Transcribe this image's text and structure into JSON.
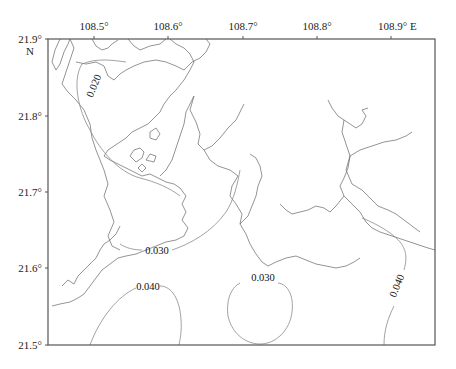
{
  "map": {
    "x_axis": {
      "ticks": [
        {
          "label": "108.5°",
          "x": 94
        },
        {
          "label": "108.6°",
          "x": 168
        },
        {
          "label": "108.7°",
          "x": 243
        },
        {
          "label": "108.8°",
          "x": 317
        },
        {
          "label": "108.9° E",
          "x": 391
        }
      ]
    },
    "y_axis": {
      "ticks": [
        {
          "label": "21.9°",
          "y": 39
        },
        {
          "label": "21.8°",
          "y": 116
        },
        {
          "label": "21.7°",
          "y": 192
        },
        {
          "label": "21.6°",
          "y": 268
        },
        {
          "label": "21.5°",
          "y": 345
        }
      ],
      "hemisphere_label": "N"
    },
    "contours": [
      {
        "value": "0.020",
        "label": "0.020"
      },
      {
        "value": "0.030",
        "label": "0.030"
      },
      {
        "value": "0.040",
        "label": "0.040"
      },
      {
        "value": "0.030",
        "label": "0.030"
      },
      {
        "value": "0.040",
        "label": "0.040"
      }
    ],
    "colors": {
      "coastline": "#666666",
      "contour": "#8a8a8a",
      "frame": "#555555"
    }
  }
}
